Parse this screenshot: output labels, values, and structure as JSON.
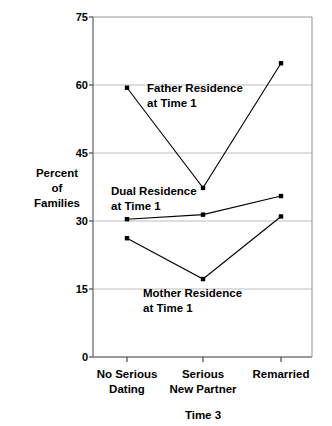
{
  "chart_data": {
    "type": "line",
    "title": "",
    "subtitle": "",
    "xlabel": "Time 3",
    "ylabel": "Percent of Families",
    "ylabel_lines": [
      "Percent",
      "of",
      "Families"
    ],
    "categories": [
      "No Serious Dating",
      "Serious New Partner",
      "Remarried"
    ],
    "category_lines": [
      [
        "No Serious",
        "Dating"
      ],
      [
        "Serious",
        "New Partner"
      ],
      [
        "Remarried"
      ]
    ],
    "ylim": [
      0,
      75
    ],
    "yticks": [
      0,
      15,
      30,
      45,
      60,
      75
    ],
    "ytick_labels": [
      "0",
      "15",
      "30",
      "45",
      "60",
      "75"
    ],
    "grid": "horizontal",
    "legend_position": "inline-annotations",
    "marker": "square",
    "series": [
      {
        "name": "Father Residence at Time 1",
        "label_lines": [
          "Father Residence",
          "at Time 1"
        ],
        "color": "#000000",
        "values": [
          59.4,
          37.3,
          64.8
        ]
      },
      {
        "name": "Dual Residence at Time 1",
        "label_lines": [
          "Dual Residence",
          "at Time 1"
        ],
        "color": "#000000",
        "values": [
          30.4,
          31.4,
          35.5
        ]
      },
      {
        "name": "Mother Residence at Time 1",
        "label_lines": [
          "Mother Residence",
          "at Time 1"
        ],
        "color": "#000000",
        "values": [
          26.2,
          17.2,
          31.0
        ]
      }
    ],
    "annotations": [
      {
        "text": "Father Residence at Time 1",
        "x": 147,
        "y": 92
      },
      {
        "text": "Dual Residence at Time 1",
        "x": 111,
        "y": 195
      },
      {
        "text": "Mother Residence at Time 1",
        "x": 143,
        "y": 297
      }
    ],
    "colors": {
      "line": "#1a1a1a",
      "grid": "#b9b9b9",
      "axis": "#6e6e6e",
      "text": "#000000",
      "background": "#ffffff"
    }
  }
}
